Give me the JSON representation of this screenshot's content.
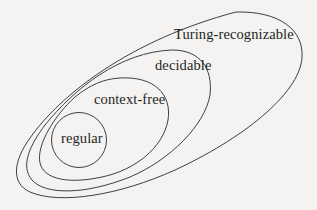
{
  "diagram": {
    "sets": [
      {
        "id": "turing-recognizable",
        "label": "Turing-recognizable"
      },
      {
        "id": "decidable",
        "label": "decidable"
      },
      {
        "id": "context-free",
        "label": "context-free"
      },
      {
        "id": "regular",
        "label": "regular"
      }
    ],
    "stroke_color": "#2a2a2a",
    "background_color": "#f4f3f1"
  }
}
